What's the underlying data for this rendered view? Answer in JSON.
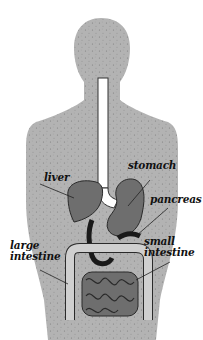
{
  "diagram": {
    "title": "",
    "colors": {
      "body": "#b3b3b3",
      "body_speckle": "#8a8a8a",
      "organ_fill": "#6e6e6e",
      "organ_outline": "#2a2a2a",
      "dark_duct": "#1a1a1a",
      "large_intestine": "#cfcfcf",
      "esophagus": "#ffffff",
      "background": "#ffffff"
    },
    "labels": [
      {
        "id": "stomach",
        "text": "stomach"
      },
      {
        "id": "liver",
        "text": "liver"
      },
      {
        "id": "pancreas",
        "text": "pancreas"
      },
      {
        "id": "large-intestine",
        "text": "large\nintestine"
      },
      {
        "id": "small-intestine",
        "text": "small\nintestine"
      }
    ]
  }
}
